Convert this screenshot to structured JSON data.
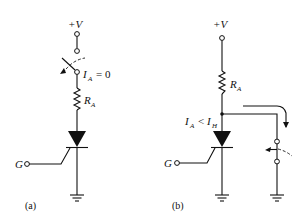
{
  "diagram": {
    "type": "circuit-schematic",
    "panels": [
      {
        "id": "a",
        "caption": "(a)",
        "supply_label": "+V",
        "switch_state": "open",
        "current_label": {
          "symbol": "I",
          "subscript": "A",
          "relation": "= 0"
        },
        "resistor_label": {
          "symbol": "R",
          "subscript": "A"
        },
        "gate_label": "G",
        "device": "SCR",
        "ground": true
      },
      {
        "id": "b",
        "caption": "(b)",
        "supply_label": "+V",
        "resistor_label": {
          "symbol": "R",
          "subscript": "A"
        },
        "current_label": {
          "symbol": "I",
          "subscript": "A",
          "relation": "<",
          "symbol2": "I",
          "subscript2": "H"
        },
        "gate_label": "G",
        "device": "SCR",
        "shunt_switch": "closing",
        "arrow": "current diverted through shunt branch",
        "ground_count": 2
      }
    ]
  },
  "colors": {
    "ink": "#111111",
    "background": "#ffffff"
  }
}
